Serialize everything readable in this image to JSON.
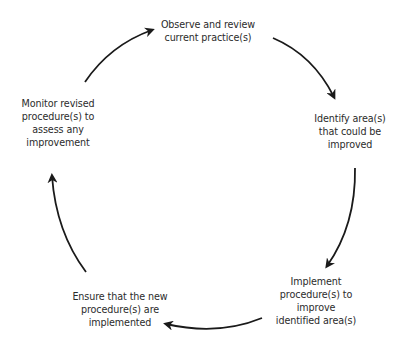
{
  "diagram": {
    "type": "cycle",
    "direction": "clockwise",
    "colors": {
      "text": "#2b2b2b",
      "arrow": "#1a1a1a",
      "background": "#ffffff"
    },
    "steps": [
      {
        "label": "Observe and review\ncurrent practice(s)"
      },
      {
        "label": "Identify area(s)\nthat could be\nimproved"
      },
      {
        "label": "Implement\nprocedure(s) to\nimprove\nidentified area(s)"
      },
      {
        "label": "Ensure that the new\nprocedure(s) are\nimplemented"
      },
      {
        "label": "Monitor revised\nprocedure(s) to\nassess any\nimprovement"
      }
    ],
    "arrows": [
      {
        "from": "Monitor revised procedure(s) to assess any improvement",
        "to": "Observe and review current practice(s)"
      },
      {
        "from": "Observe and review current practice(s)",
        "to": "Identify area(s) that could be improved"
      },
      {
        "from": "Identify area(s) that could be improved",
        "to": "Implement procedure(s) to improve identified area(s)"
      },
      {
        "from": "Implement procedure(s) to improve identified area(s)",
        "to": "Ensure that the new procedure(s) are implemented"
      },
      {
        "from": "Ensure that the new procedure(s) are implemented",
        "to": "Monitor revised procedure(s) to assess any improvement"
      }
    ]
  }
}
